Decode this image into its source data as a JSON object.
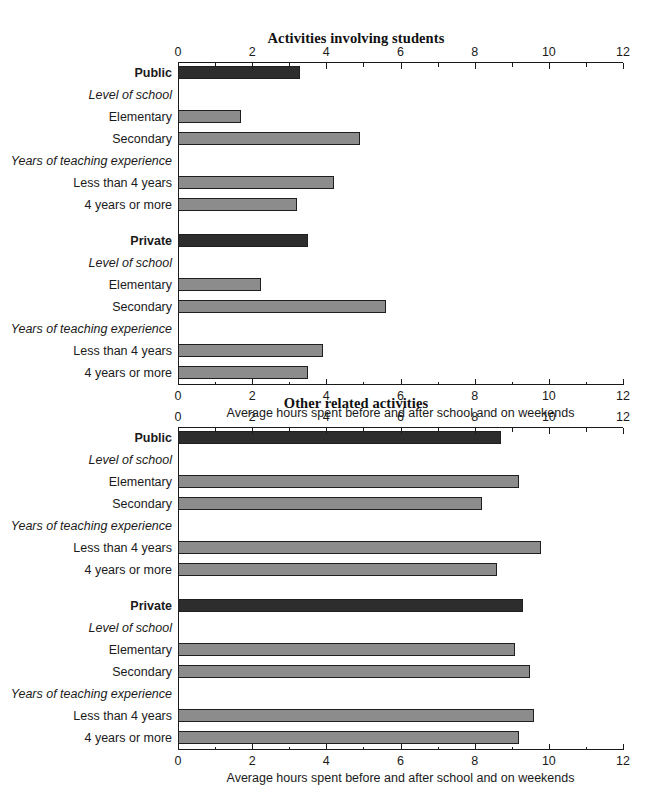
{
  "chart_data": [
    {
      "type": "bar",
      "title": "Activities involving students",
      "xlabel": "Average hours spent before and after school and on weekends",
      "ylabel": "",
      "xlim": [
        0,
        12
      ],
      "xticks": [
        0,
        2,
        4,
        6,
        8,
        10,
        12
      ],
      "xtick_labels": [
        "0",
        "2",
        "4",
        "6",
        "8",
        "10",
        "12"
      ],
      "minor_xticks": [
        1,
        3,
        5,
        7,
        9,
        11
      ],
      "grid": false,
      "legend": "none",
      "orientation": "horizontal",
      "rows": [
        {
          "label": "Public",
          "style": "group",
          "value": 3.3,
          "color": "dark"
        },
        {
          "label": "Level of school",
          "style": "sub",
          "value": null,
          "color": "none"
        },
        {
          "label": "Elementary",
          "style": "item",
          "value": 1.7,
          "color": "light"
        },
        {
          "label": "Secondary",
          "style": "item",
          "value": 4.9,
          "color": "light"
        },
        {
          "label": "Years of teaching experience",
          "style": "sub",
          "value": null,
          "color": "none"
        },
        {
          "label": "Less than 4 years",
          "style": "item",
          "value": 4.2,
          "color": "light"
        },
        {
          "label": "4 years or more",
          "style": "item",
          "value": 3.2,
          "color": "light"
        },
        {
          "label": "",
          "style": "spacer",
          "value": null,
          "color": "none"
        },
        {
          "label": "Private",
          "style": "group",
          "value": 3.5,
          "color": "dark"
        },
        {
          "label": "Level of school",
          "style": "sub",
          "value": null,
          "color": "none"
        },
        {
          "label": "Elementary",
          "style": "item",
          "value": 2.25,
          "color": "light"
        },
        {
          "label": "Secondary",
          "style": "item",
          "value": 5.6,
          "color": "light"
        },
        {
          "label": "Years of teaching experience",
          "style": "sub",
          "value": null,
          "color": "none"
        },
        {
          "label": "Less than 4 years",
          "style": "item",
          "value": 3.9,
          "color": "light"
        },
        {
          "label": "4 years or more",
          "style": "item",
          "value": 3.5,
          "color": "light"
        }
      ]
    },
    {
      "type": "bar",
      "title": "Other related activities",
      "xlabel": "Average hours spent before and after school and on weekends",
      "ylabel": "",
      "xlim": [
        0,
        12
      ],
      "xticks": [
        0,
        2,
        4,
        6,
        8,
        10,
        12
      ],
      "xtick_labels": [
        "0",
        "2",
        "4",
        "6",
        "8",
        "10",
        "12"
      ],
      "minor_xticks": [
        1,
        3,
        5,
        7,
        9,
        11
      ],
      "grid": false,
      "legend": "none",
      "orientation": "horizontal",
      "rows": [
        {
          "label": "Public",
          "style": "group",
          "value": 8.7,
          "color": "dark"
        },
        {
          "label": "Level of school",
          "style": "sub",
          "value": null,
          "color": "none"
        },
        {
          "label": "Elementary",
          "style": "item",
          "value": 9.2,
          "color": "light"
        },
        {
          "label": "Secondary",
          "style": "item",
          "value": 8.2,
          "color": "light"
        },
        {
          "label": "Years of teaching experience",
          "style": "sub",
          "value": null,
          "color": "none"
        },
        {
          "label": "Less than 4 years",
          "style": "item",
          "value": 9.8,
          "color": "light"
        },
        {
          "label": "4 years or more",
          "style": "item",
          "value": 8.6,
          "color": "light"
        },
        {
          "label": "",
          "style": "spacer",
          "value": null,
          "color": "none"
        },
        {
          "label": "Private",
          "style": "group",
          "value": 9.3,
          "color": "dark"
        },
        {
          "label": "Level of school",
          "style": "sub",
          "value": null,
          "color": "none"
        },
        {
          "label": "Elementary",
          "style": "item",
          "value": 9.1,
          "color": "light"
        },
        {
          "label": "Secondary",
          "style": "item",
          "value": 9.5,
          "color": "light"
        },
        {
          "label": "Years of teaching experience",
          "style": "sub",
          "value": null,
          "color": "none"
        },
        {
          "label": "Less than 4 years",
          "style": "item",
          "value": 9.6,
          "color": "light"
        },
        {
          "label": "4 years or more",
          "style": "item",
          "value": 9.2,
          "color": "light"
        }
      ]
    }
  ],
  "colors": {
    "bar_dark": "#2d2d2d",
    "bar_light": "#8c8c8c",
    "axis": "#1a1a1a",
    "background": "#ffffff"
  }
}
